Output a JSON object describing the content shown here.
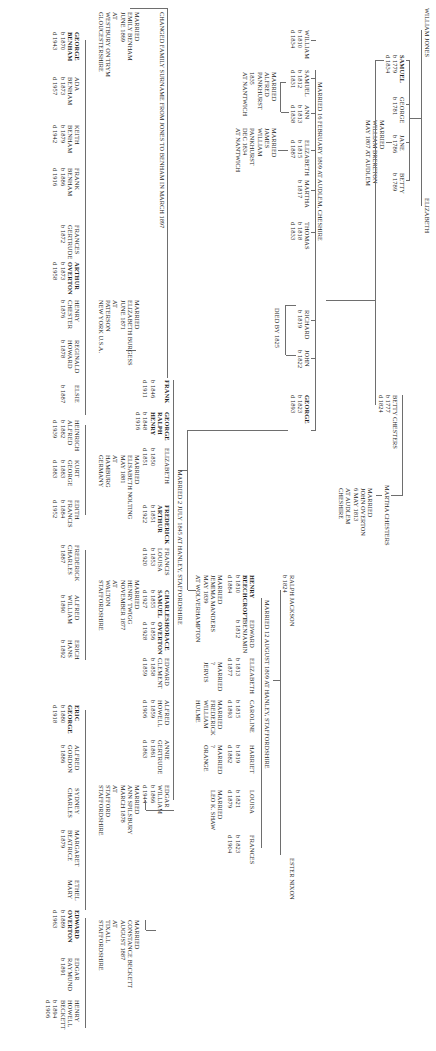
{
  "document": {
    "type": "family-tree",
    "orientation": "rotated-90-clockwise"
  },
  "generation1": {
    "parents": {
      "father": "WILLIAM JONES",
      "mother": "ELIZABETH"
    },
    "children": [
      {
        "name": "SAMUEL",
        "bold": true,
        "born": "b 1779",
        "died": "d 1834"
      },
      {
        "name": "GEORGE",
        "born": "b 1781"
      },
      {
        "name": "JANE",
        "born": "b 1786",
        "marriage": [
          "MARRIED",
          "WILLIAM BRERETON",
          "MAY 1807 AT AUDLEM"
        ]
      },
      {
        "name": "BETTY",
        "born": "b 1789"
      }
    ]
  },
  "chesters": {
    "betty": {
      "name": "BETTY CHESTERS",
      "born": "b 1777",
      "died": "d 1824"
    },
    "martha": {
      "name": "MARTHA CHESTERS",
      "marriage": [
        "MARRIED",
        "JOHN OVERTON",
        "6 MAY 1813",
        "AT AUDLEM",
        "CHESHIRE"
      ]
    }
  },
  "samuel_family": {
    "marriage_label": "MARRIED 16 FEBRUARY 1809 AT AUDLEM, CHESHIRE",
    "died_note": "DIED BY 1825",
    "children": [
      {
        "name": "WILLIAM",
        "born": "b 1810",
        "died": "d 1834"
      },
      {
        "name": "SAMUEL",
        "born": "b 1812",
        "died": "d 1831",
        "marriage": [
          "MARRIED",
          "ALFRED",
          "PANKHURST",
          "1835",
          "AT NANTWICH"
        ]
      },
      {
        "name": "ANN",
        "born": "b 1813",
        "died": "d 1838"
      },
      {
        "name": "ELIZABETH",
        "born": "b 1815",
        "died": "d 1887",
        "marriage": [
          "MARRIED",
          "JAMES",
          "WILLIAM",
          "PANKHURST",
          "DEC 1834",
          "AT NANTWICH"
        ]
      },
      {
        "name": "MARTHA",
        "born": "b 1817"
      },
      {
        "name": "THOMAS",
        "born": "b 1818",
        "died": "d 1833"
      },
      {
        "name": "RICHARD",
        "born": "b 1819"
      },
      {
        "name": "JOHN",
        "born": "b 1822"
      },
      {
        "name": "GEORGE",
        "bold": true,
        "born": "b 1823",
        "died": "d 1893"
      }
    ]
  },
  "jackson": {
    "parents": {
      "father": "RALPH JACKSON",
      "father_born": "b 1824",
      "mother": "ESTER NIXON"
    },
    "marriage_label": "MARRIED 12 AUGUST 1809 AT HANLEY, STAFFORDSHIRE",
    "children": [
      {
        "name": "HENRY",
        "name2": "BEECHCROFT",
        "bold": true,
        "born": "b 1810",
        "died": "d 1884",
        "marriage": [
          "MARRIED",
          "JEMIMA MANDERS",
          "MAY 1839",
          "AT WOLVERHAMPTON"
        ]
      },
      {
        "name": "EDWARD",
        "name2": "BENJAMIN",
        "born": "b 1812"
      },
      {
        "name": "ELIZABETH",
        "born": "b 1813",
        "died": "d 1877",
        "marriage": [
          "MARRIED",
          "?",
          "JERVIS"
        ]
      },
      {
        "name": "CAROLINE",
        "born": "b 1815",
        "died": "d 1893",
        "marriage": [
          "MARRIED",
          "FREDERICK",
          "WILLIAM",
          "HULME"
        ]
      },
      {
        "name": "HARRIET",
        "born": "b 1819",
        "died": "d 1882",
        "marriage": [
          "MARRIED",
          "?",
          "ORANGE"
        ]
      },
      {
        "name": "LOUISA",
        "born": "b 1821",
        "died": "d 1879",
        "marriage": [
          "MARRIED",
          "LEO K. SHAW"
        ]
      },
      {
        "name": "FRANCES",
        "born": "b 1823",
        "died": "d 1904"
      }
    ]
  },
  "george_family": {
    "marriage_label": "MARRIED 2 JULY 1845 AT HANLEY, STAFFORDSHIRE",
    "surname_note": "CHANGED FAMILY SURNAME FROM JONES TO BENHAM IN MARCH 1897",
    "children": [
      {
        "name": "FRANK",
        "bold": true,
        "born": "b 1846",
        "died": "d 1911",
        "marriage": [
          "MARRIED",
          "EMILY BENHAM",
          "JUNE 1869",
          "AT",
          "WESTBURY ON TRYM",
          "GLOUCESTERSHIRE"
        ]
      },
      {
        "name": "GEORGE",
        "name2": "RALPH",
        "name3": "HENRY",
        "bold": true,
        "born": "b 1848",
        "died": "d 1916",
        "marriage": [
          "MARRIED",
          "ELIZABETH BURGESS",
          "JUNE 1871",
          "AT",
          "PATERSON",
          "NEW YORK U.S.A."
        ]
      },
      {
        "name": "ELIZABETH",
        "born": "b 1850",
        "died": "d 1851"
      },
      {
        "name": "FREDERICK",
        "name2": "ARTHUR",
        "bold": true,
        "born": "b 1851",
        "died": "d 1922",
        "marriage": [
          "MARRIED",
          "ELISABETH NOLTING",
          "MAY 1881",
          "AT",
          "HAMBURG",
          "GERMANY"
        ]
      },
      {
        "name": "FRANCIS",
        "name2": "LOUISA",
        "born": "b 1853",
        "died": "d 1920",
        "marriage": [
          "MARRIED",
          "HENRY TWIGG",
          "NOVEMBER 1877",
          "AT",
          "WALTON",
          "STAFFORDSHIRE"
        ]
      },
      {
        "name": "CHARLES",
        "name2": "SAMUEL",
        "bold": true,
        "born": "b 1855",
        "died": "d 1927",
        "marriage": [
          "MARRIED",
          "ANN SPILSBURY",
          "MARCH 1878",
          "AT",
          "STAFFORD",
          "STAFFORDSHIRE"
        ]
      },
      {
        "name": "HORACE",
        "name2": "OVERTON",
        "bold": true,
        "born": "b 1856",
        "died": "d 1928",
        "marriage": [
          "MARRIED",
          "CONSTANCE BECKETT",
          "AUGUST 1887",
          "AT",
          "TIXALL",
          "STAFFORDSHIRE"
        ]
      },
      {
        "name": "EDWARD",
        "name2": "CLEMENT",
        "born": "b 1858",
        "died": "d 1859"
      },
      {
        "name": "ALFRED",
        "name2": "HOWELL",
        "born": "b 1859",
        "died": "d 1906"
      },
      {
        "name": "ANNIE",
        "name2": "GERTRUDE",
        "born": "b 1861",
        "died": "d 1863"
      },
      {
        "name": "EDGAR",
        "name2": "WILLIAM",
        "born": "b 1866",
        "died": "d 1944"
      }
    ]
  },
  "generation4": {
    "frank_children": [
      {
        "name": "GEORGE",
        "name2": "BENHAM",
        "bold": true,
        "born": "b 1870",
        "died": "d 1943"
      },
      {
        "name": "ADA",
        "name2": "BENHAM",
        "born": "b 1873",
        "died": "d 1957"
      },
      {
        "name": "KEITH",
        "name2": "BENHAM",
        "born": "b 1879",
        "died": "d 1942"
      },
      {
        "name": "FRANK",
        "name2": "BENHAM",
        "born": "b 1886",
        "died": "d 1916"
      }
    ],
    "george_ralph_children": [
      {
        "name": "FRANCES",
        "name2": "GERTRUDE",
        "born": "b 1872"
      },
      {
        "name": "ARTHUR",
        "name2": "OVERTON",
        "bold": true,
        "born": "b 1873",
        "died": "d 1958"
      },
      {
        "name": "HENRY",
        "name2": "CHESTER",
        "born": "b 1876"
      },
      {
        "name": "REGINALD",
        "name2": "HOWARD",
        "born": "b 1878"
      },
      {
        "name": "ELSIE",
        "born": "b 1887"
      }
    ],
    "frederick_children": [
      {
        "name": "HEINRICH",
        "name2": "ALFRED",
        "born": "b 1882",
        "died": "d 1939"
      },
      {
        "name": "KURT",
        "name2": "GEORGE",
        "born": "b 1883",
        "died": "d 1883"
      },
      {
        "name": "EDITH",
        "name2": "FRANCIS",
        "born": "b 1884",
        "died": "d 1952"
      }
    ],
    "francis_children": [
      {
        "name": "FREDERICK",
        "name2": "CHARLES",
        "born": "b 1887"
      },
      {
        "name": "ALFRED",
        "name2": "WILLIAM",
        "born": "b 1890"
      },
      {
        "name": "ERICH",
        "name2": "HANS",
        "born": "b 1892"
      }
    ],
    "charles_children": [
      {
        "name": "ERIC",
        "name2": "GEORGE",
        "bold": true,
        "born": "b 1880",
        "died": "d 1918"
      },
      {
        "name": "ALFRED",
        "name2": "GORDON",
        "born": "b 1886"
      },
      {
        "name": "SYDNEY",
        "name2": "CHARLES"
      },
      {
        "name": "MARGARET",
        "name2": "BEATRICE",
        "born": "b 1879"
      },
      {
        "name": "ETHEL",
        "name2": "MARY"
      }
    ],
    "horace_children": [
      {
        "name": "EDWARD",
        "name2": "OVERTON",
        "bold": true,
        "born": "b 1889",
        "died": "d 1963"
      },
      {
        "name": "EDGAR",
        "name2": "RAYMUND",
        "born": "b 1891"
      },
      {
        "name": "HENRY",
        "name2": "HOWELL",
        "name3": "BECKETT",
        "born": "b 1894",
        "died": "d 1906"
      }
    ]
  }
}
